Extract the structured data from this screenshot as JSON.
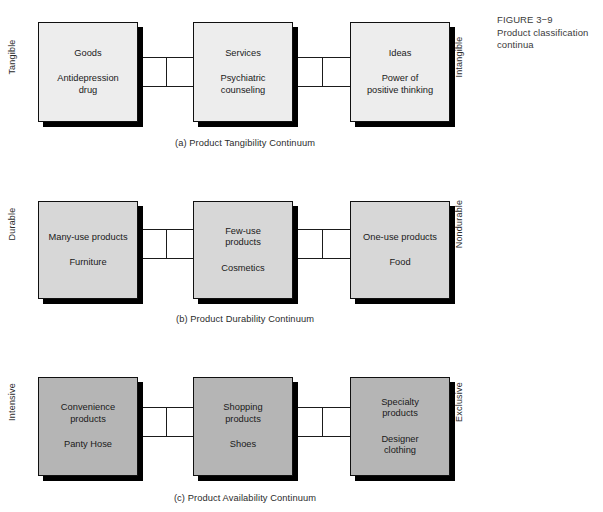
{
  "figure": {
    "number": "FIGURE 3−9",
    "title": "Product classification continua"
  },
  "continua": [
    {
      "id": "tangibility",
      "left_label": "Tangible",
      "right_label": "Intangible",
      "caption": "(a) Product Tangibility Continuum",
      "fill_color": "#ededed",
      "boxes": [
        {
          "category": "Goods",
          "example_line1": "Antidepression",
          "example_line2": "drug"
        },
        {
          "category": "Services",
          "example_line1": "Psychiatric",
          "example_line2": "counseling"
        },
        {
          "category": "Ideas",
          "example_line1": "Power of",
          "example_line2": "positive thinking"
        }
      ]
    },
    {
      "id": "durability",
      "left_label": "Durable",
      "right_label": "Nondurable",
      "caption": "(b) Product Durability Continuum",
      "fill_color": "#d7d7d7",
      "boxes": [
        {
          "category": "Many-use products",
          "category_line2": "",
          "example_line1": "Furniture",
          "example_line2": ""
        },
        {
          "category": "Few-use",
          "category_line2": "products",
          "example_line1": "Cosmetics",
          "example_line2": ""
        },
        {
          "category": "One-use products",
          "category_line2": "",
          "example_line1": "Food",
          "example_line2": ""
        }
      ]
    },
    {
      "id": "availability",
      "left_label": "Intensive",
      "right_label": "Exclusive",
      "caption": "(c) Product Availability Continuum",
      "fill_color": "#b5b5b5",
      "boxes": [
        {
          "category": "Convenience",
          "category_line2": "products",
          "example_line1": "Panty Hose",
          "example_line2": ""
        },
        {
          "category": "Shopping",
          "category_line2": "products",
          "example_line1": "Shoes",
          "example_line2": ""
        },
        {
          "category": "Specialty",
          "category_line2": "products",
          "example_line1": "Designer",
          "example_line2": "clothing"
        }
      ]
    }
  ]
}
